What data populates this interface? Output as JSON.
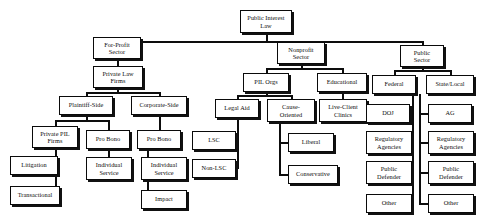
{
  "diagram": {
    "title": "Public Interest Law",
    "type": "organizational-tree",
    "orientation": "top-down",
    "line_color": "#0d0d0d",
    "box_fill": "#ffffff",
    "box_border": "#0a0a0a",
    "nodes": [
      {
        "id": "root",
        "label": "Public Interest\nLaw",
        "x": 240,
        "y": 10,
        "w": 52,
        "h": 23,
        "level": 0
      },
      {
        "id": "forprofit",
        "label": "For-Profit\nSector",
        "x": 93,
        "y": 37,
        "w": 48,
        "h": 22,
        "level": 1
      },
      {
        "id": "nonprofit",
        "label": "Nonprofit\nSector",
        "x": 277,
        "y": 42,
        "w": 48,
        "h": 22,
        "level": 1
      },
      {
        "id": "public",
        "label": "Public\nSector",
        "x": 400,
        "y": 45,
        "w": 44,
        "h": 22,
        "level": 1
      },
      {
        "id": "privatelaw",
        "label": "Private Law\nFirms",
        "x": 93,
        "y": 66,
        "w": 50,
        "h": 22,
        "level": 2
      },
      {
        "id": "plaintiff",
        "label": "Plaintiff-Side",
        "x": 59,
        "y": 96,
        "w": 54,
        "h": 19,
        "level": 3
      },
      {
        "id": "corporate",
        "label": "Corporate-Side",
        "x": 131,
        "y": 96,
        "w": 56,
        "h": 19,
        "level": 3
      },
      {
        "id": "pilorgs",
        "label": "PIL Orgs",
        "x": 243,
        "y": 73,
        "w": 46,
        "h": 19,
        "level": 2
      },
      {
        "id": "educational",
        "label": "Educational",
        "x": 317,
        "y": 73,
        "w": 50,
        "h": 19,
        "level": 2
      },
      {
        "id": "federal",
        "label": "Federal",
        "x": 372,
        "y": 75,
        "w": 44,
        "h": 19,
        "level": 2
      },
      {
        "id": "statelocal",
        "label": "State/Local",
        "x": 426,
        "y": 75,
        "w": 48,
        "h": 19,
        "level": 2
      },
      {
        "id": "privatepil",
        "label": "Private PIL\nFirms",
        "x": 32,
        "y": 126,
        "w": 46,
        "h": 22,
        "level": 4
      },
      {
        "id": "probono_p",
        "label": "Pro Bono",
        "x": 86,
        "y": 130,
        "w": 44,
        "h": 19,
        "level": 4
      },
      {
        "id": "probono_c",
        "label": "Pro Bono",
        "x": 137,
        "y": 130,
        "w": 44,
        "h": 19,
        "level": 4
      },
      {
        "id": "legalaid",
        "label": "Legal Aid",
        "x": 215,
        "y": 99,
        "w": 44,
        "h": 19,
        "level": 3
      },
      {
        "id": "cause",
        "label": "Cause-\nOriented",
        "x": 267,
        "y": 99,
        "w": 48,
        "h": 23,
        "level": 3
      },
      {
        "id": "liveclient",
        "label": "Live-Client\nClinics",
        "x": 319,
        "y": 99,
        "w": 48,
        "h": 23,
        "level": 3
      },
      {
        "id": "doj",
        "label": "DOJ",
        "x": 366,
        "y": 104,
        "w": 44,
        "h": 19,
        "level": 3
      },
      {
        "id": "ag",
        "label": "AG",
        "x": 428,
        "y": 104,
        "w": 44,
        "h": 19,
        "level": 3
      },
      {
        "id": "litigation",
        "label": "Litigation",
        "x": 10,
        "y": 156,
        "w": 48,
        "h": 19,
        "level": 5
      },
      {
        "id": "transactional",
        "label": "Transactional",
        "x": 10,
        "y": 186,
        "w": 50,
        "h": 19,
        "level": 5
      },
      {
        "id": "indiv_p",
        "label": "Individual\nService",
        "x": 86,
        "y": 157,
        "w": 46,
        "h": 23,
        "level": 5
      },
      {
        "id": "indiv_c",
        "label": "Individual\nService",
        "x": 141,
        "y": 157,
        "w": 46,
        "h": 23,
        "level": 5
      },
      {
        "id": "impact",
        "label": "Impact",
        "x": 141,
        "y": 190,
        "w": 46,
        "h": 19,
        "level": 5
      },
      {
        "id": "lsc",
        "label": "LSC",
        "x": 192,
        "y": 131,
        "w": 44,
        "h": 19,
        "level": 4
      },
      {
        "id": "nonlsc",
        "label": "Non-LSC",
        "x": 192,
        "y": 159,
        "w": 44,
        "h": 19,
        "level": 4
      },
      {
        "id": "liberal",
        "label": "Liberal",
        "x": 288,
        "y": 133,
        "w": 46,
        "h": 19,
        "level": 4
      },
      {
        "id": "conservative",
        "label": "Conservative",
        "x": 288,
        "y": 165,
        "w": 50,
        "h": 19,
        "level": 4
      },
      {
        "id": "reg_fed",
        "label": "Regulatory\nAgencies",
        "x": 366,
        "y": 131,
        "w": 46,
        "h": 23,
        "level": 3
      },
      {
        "id": "pd_fed",
        "label": "Public\nDefender",
        "x": 366,
        "y": 161,
        "w": 46,
        "h": 23,
        "level": 3
      },
      {
        "id": "other_fed",
        "label": "Other",
        "x": 366,
        "y": 194,
        "w": 46,
        "h": 19,
        "level": 3
      },
      {
        "id": "reg_st",
        "label": "Regulatory\nAgencies",
        "x": 428,
        "y": 131,
        "w": 46,
        "h": 23,
        "level": 3
      },
      {
        "id": "pd_st",
        "label": "Public\nDefender",
        "x": 428,
        "y": 161,
        "w": 46,
        "h": 23,
        "level": 3
      },
      {
        "id": "other_st",
        "label": "Other",
        "x": 428,
        "y": 194,
        "w": 46,
        "h": 19,
        "level": 3
      }
    ],
    "connectors": [
      {
        "name": "root-stem",
        "o": "v",
        "x": 266,
        "y": 33,
        "len": 8
      },
      {
        "name": "root-bus",
        "o": "h",
        "x": 117,
        "y": 41,
        "len": 305
      },
      {
        "name": "drop-forprofit",
        "o": "v",
        "x": 117,
        "y": 41,
        "len": 8
      },
      {
        "name": "drop-nonprofit",
        "o": "v",
        "x": 301,
        "y": 41,
        "len": 6
      },
      {
        "name": "drop-public",
        "o": "v",
        "x": 422,
        "y": 41,
        "len": 9
      },
      {
        "name": "forprofit-stem",
        "o": "v",
        "x": 117,
        "y": 59,
        "len": 7
      },
      {
        "name": "privatelaw-stem",
        "o": "v",
        "x": 117,
        "y": 88,
        "len": 5
      },
      {
        "name": "privatelaw-bus",
        "o": "h",
        "x": 86,
        "y": 92,
        "len": 73
      },
      {
        "name": "drop-plaintiff",
        "o": "v",
        "x": 86,
        "y": 92,
        "len": 7
      },
      {
        "name": "drop-corporate",
        "o": "v",
        "x": 159,
        "y": 92,
        "len": 7
      },
      {
        "name": "plaintiff-stem",
        "o": "v",
        "x": 86,
        "y": 115,
        "len": 6
      },
      {
        "name": "plaintiff-bus",
        "o": "h",
        "x": 55,
        "y": 120,
        "len": 53
      },
      {
        "name": "drop-privatepil",
        "o": "v",
        "x": 55,
        "y": 120,
        "len": 7
      },
      {
        "name": "drop-probono-p",
        "o": "v",
        "x": 108,
        "y": 120,
        "len": 11
      },
      {
        "name": "privatepil-trunk",
        "o": "v",
        "x": 55,
        "y": 148,
        "len": 48
      },
      {
        "name": "litigation-link",
        "o": "h",
        "x": 55,
        "y": 166,
        "len": 4
      },
      {
        "name": "transactional-link",
        "o": "h",
        "x": 55,
        "y": 196,
        "len": 6
      },
      {
        "name": "probono-p-trunk",
        "o": "v",
        "x": 108,
        "y": 149,
        "len": 20
      },
      {
        "name": "corporate-stem",
        "o": "v",
        "x": 159,
        "y": 115,
        "len": 15
      },
      {
        "name": "corp-bus",
        "o": "h",
        "x": 159,
        "y": 128,
        "len": 1
      },
      {
        "name": "probono-c-trunk",
        "o": "v",
        "x": 147,
        "y": 149,
        "len": 52
      },
      {
        "name": "indiv-c-link",
        "o": "h",
        "x": 147,
        "y": 168,
        "len": 1
      },
      {
        "name": "impact-link",
        "o": "h",
        "x": 147,
        "y": 199,
        "len": 1
      },
      {
        "name": "nonprofit-stem",
        "o": "v",
        "x": 301,
        "y": 64,
        "len": 5
      },
      {
        "name": "nonprofit-bus",
        "o": "h",
        "x": 266,
        "y": 68,
        "len": 76
      },
      {
        "name": "drop-pilorgs",
        "o": "v",
        "x": 266,
        "y": 68,
        "len": 6
      },
      {
        "name": "drop-educational",
        "o": "v",
        "x": 342,
        "y": 68,
        "len": 6
      },
      {
        "name": "pilorgs-stem",
        "o": "v",
        "x": 266,
        "y": 92,
        "len": 3
      },
      {
        "name": "pilorgs-bus",
        "o": "h",
        "x": 237,
        "y": 95,
        "len": 54
      },
      {
        "name": "drop-legalaid",
        "o": "v",
        "x": 237,
        "y": 95,
        "len": 5
      },
      {
        "name": "drop-cause",
        "o": "v",
        "x": 291,
        "y": 95,
        "len": 5
      },
      {
        "name": "legalaid-trunk",
        "o": "v",
        "x": 237,
        "y": 118,
        "len": 51
      },
      {
        "name": "lsc-link",
        "o": "h",
        "x": 236,
        "y": 140,
        "len": 2
      },
      {
        "name": "nonlsc-link",
        "o": "h",
        "x": 236,
        "y": 168,
        "len": 2
      },
      {
        "name": "cause-trunk",
        "o": "v",
        "x": 279,
        "y": 122,
        "len": 53
      },
      {
        "name": "liberal-link",
        "o": "h",
        "x": 279,
        "y": 142,
        "len": 10
      },
      {
        "name": "conservative-link",
        "o": "h",
        "x": 279,
        "y": 174,
        "len": 10
      },
      {
        "name": "educational-stem",
        "o": "v",
        "x": 342,
        "y": 92,
        "len": 8
      },
      {
        "name": "public-stem",
        "o": "v",
        "x": 422,
        "y": 67,
        "len": 4
      },
      {
        "name": "public-bus",
        "o": "h",
        "x": 394,
        "y": 70,
        "len": 56
      },
      {
        "name": "drop-federal",
        "o": "v",
        "x": 394,
        "y": 70,
        "len": 6
      },
      {
        "name": "drop-statelocal",
        "o": "v",
        "x": 450,
        "y": 70,
        "len": 6
      },
      {
        "name": "federal-trunk",
        "o": "v",
        "x": 412,
        "y": 94,
        "len": 110
      },
      {
        "name": "doj-link",
        "o": "h",
        "x": 409,
        "y": 113,
        "len": 4
      },
      {
        "name": "regfed-link",
        "o": "h",
        "x": 411,
        "y": 142,
        "len": 2
      },
      {
        "name": "pdfed-link",
        "o": "h",
        "x": 411,
        "y": 172,
        "len": 2
      },
      {
        "name": "otherfed-link",
        "o": "h",
        "x": 411,
        "y": 203,
        "len": 2
      },
      {
        "name": "statelocal-trunk",
        "o": "v",
        "x": 419,
        "y": 94,
        "len": 110
      },
      {
        "name": "ag-link",
        "o": "h",
        "x": 419,
        "y": 113,
        "len": 10
      },
      {
        "name": "regst-link",
        "o": "h",
        "x": 419,
        "y": 142,
        "len": 10
      },
      {
        "name": "pdst-link",
        "o": "h",
        "x": 419,
        "y": 172,
        "len": 10
      },
      {
        "name": "otherst-link",
        "o": "h",
        "x": 419,
        "y": 203,
        "len": 10
      }
    ]
  }
}
